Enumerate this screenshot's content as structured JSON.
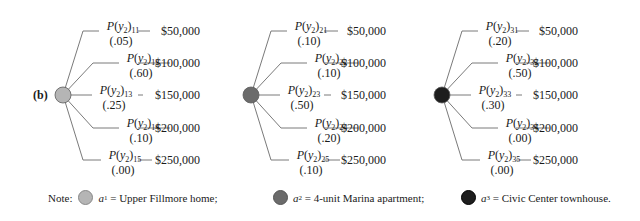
{
  "part_label": "(b)",
  "colors": {
    "line": "#7a7a7a",
    "node_a1": "#b5b5b5",
    "node_a2": "#6b6b6b",
    "node_a3": "#1e1e1e"
  },
  "trees": [
    {
      "node": "a1",
      "branches": [
        {
          "label": "P(y2)11",
          "sub": "11",
          "prob": "(.05)",
          "payoff": "$50,000"
        },
        {
          "label": "P(y2)12",
          "sub": "12",
          "prob": "(.60)",
          "payoff": "$100,000"
        },
        {
          "label": "P(y2)13",
          "sub": "13",
          "prob": "(.25)",
          "payoff": "$150,000"
        },
        {
          "label": "P(y2)14",
          "sub": "14",
          "prob": "(.10)",
          "payoff": "$200,000"
        },
        {
          "label": "P(y2)15",
          "sub": "15",
          "prob": "(.00)",
          "payoff": "$250,000"
        }
      ]
    },
    {
      "node": "a2",
      "branches": [
        {
          "label": "P(y2)21",
          "sub": "21",
          "prob": "(.10)",
          "payoff": "$50,000"
        },
        {
          "label": "P(y2)22",
          "sub": "22",
          "prob": "(.10)",
          "payoff": "$100,000"
        },
        {
          "label": "P(y2)23",
          "sub": "23",
          "prob": "(.50)",
          "payoff": "$150,000"
        },
        {
          "label": "P(y2)24",
          "sub": "24",
          "prob": "(.20)",
          "payoff": "$200,000"
        },
        {
          "label": "P(y2)25",
          "sub": "25",
          "prob": "(.10)",
          "payoff": "$250,000"
        }
      ]
    },
    {
      "node": "a3",
      "branches": [
        {
          "label": "P(y2)31",
          "sub": "31",
          "prob": "(.20)",
          "payoff": "$50,000"
        },
        {
          "label": "P(y2)32",
          "sub": "32",
          "prob": "(.50)",
          "payoff": "$100,000"
        },
        {
          "label": "P(y2)33",
          "sub": "33",
          "prob": "(.30)",
          "payoff": "$150,000"
        },
        {
          "label": "P(y2)34",
          "sub": "34",
          "prob": "(.00)",
          "payoff": "$200,000"
        },
        {
          "label": "P(y2)35",
          "sub": "35",
          "prob": "(.00)",
          "payoff": "$250,000"
        }
      ]
    }
  ],
  "note": {
    "prefix": "Note:",
    "items": [
      {
        "var": "a",
        "sub": "1",
        "text": " = Upper Fillmore home;"
      },
      {
        "var": "a",
        "sub": "2",
        "text": " = 4-unit Marina apartment;"
      },
      {
        "var": "a",
        "sub": "3",
        "text": " = Civic Center townhouse."
      }
    ]
  }
}
